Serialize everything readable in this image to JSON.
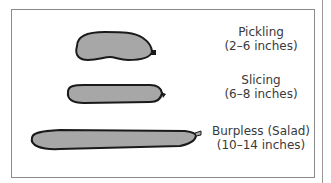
{
  "items": [
    {
      "name": "Pickling",
      "size": "(2–6 inches)"
    },
    {
      "name": "Slicing",
      "size": "(6–8 inches)"
    },
    {
      "name": "Burpless (Salad)",
      "size": "(10–14 inches)"
    }
  ],
  "colors": {
    "fill": "#a7a7a7",
    "outline": "#1a1a1a",
    "text": "#3a3a3a",
    "border": "#8a8a8a"
  }
}
